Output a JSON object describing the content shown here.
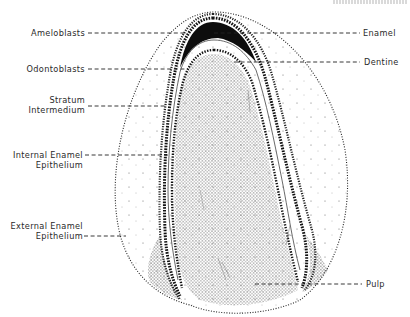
{
  "figure": {
    "colors": {
      "ink": "#1a1a1a",
      "enamel": "#0d0d0d",
      "background": "#ffffff"
    },
    "labels_left": [
      {
        "id": "ameloblasts",
        "lines": [
          "Ameloblasts"
        ]
      },
      {
        "id": "odontoblasts",
        "lines": [
          "Odontoblasts"
        ]
      },
      {
        "id": "stratum-intermedium",
        "lines": [
          "Stratum",
          "Intermedium"
        ]
      },
      {
        "id": "internal-enamel-epithelium",
        "lines": [
          "Internal Enamel",
          "Epithelium"
        ]
      },
      {
        "id": "external-enamel-epithelium",
        "lines": [
          "External Enamel",
          "Epithelium"
        ]
      }
    ],
    "labels_right": [
      {
        "id": "enamel",
        "lines": [
          "Enamel"
        ]
      },
      {
        "id": "dentine",
        "lines": [
          "Dentine"
        ]
      },
      {
        "id": "pulp",
        "lines": [
          "Pulp"
        ]
      }
    ]
  }
}
